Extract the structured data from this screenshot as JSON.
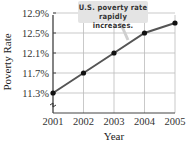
{
  "chart_data": {
    "type": "line",
    "title": "",
    "xlabel": "Year",
    "ylabel": "Poverty Rate",
    "categories": [
      "2001",
      "2002",
      "2003",
      "2004",
      "2005"
    ],
    "series": [
      {
        "name": "U.S. poverty rate",
        "values": [
          11.3,
          11.7,
          12.1,
          12.5,
          12.7
        ]
      }
    ],
    "yticks": [
      "11.3%",
      "11.7%",
      "12.1%",
      "12.5%",
      "12.9%"
    ],
    "ylim": [
      11.0,
      12.9
    ],
    "grid": true,
    "axis_break": true,
    "annotation": {
      "line1": "U.S. poverty rate",
      "line2": "rapidly increases."
    },
    "colors": {
      "line": "#555555",
      "marker": "#111111",
      "grid": "#bbbbbb",
      "callout_bg": "#e4e4e4"
    }
  }
}
